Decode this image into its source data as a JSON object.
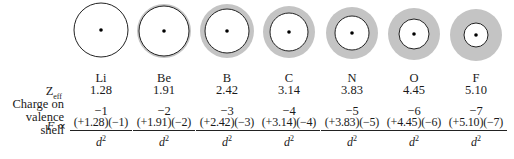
{
  "labels": {
    "zeff_main": "Z",
    "zeff_sub": "eff",
    "charge_line1": "Charge on",
    "charge_line2": "valence shell",
    "force_symbol": "F",
    "proportional": " ∝",
    "denominator_var": "d",
    "denominator_exp": "2"
  },
  "colors": {
    "shell_gray": "#c4c4c4",
    "outline": "#222222",
    "nucleus": "#000000"
  },
  "elements": [
    {
      "symbol": "Li",
      "zeff": "1.28",
      "charge": "−1",
      "numerator": "(+1.28)(−1)",
      "outer_r": 27,
      "inner_r": 27,
      "cx": 101,
      "cy": 30
    },
    {
      "symbol": "Be",
      "zeff": "1.91",
      "charge": "−2",
      "numerator": "(+1.91)(−2)",
      "outer_r": 27,
      "inner_r": 25,
      "cx": 164,
      "cy": 31
    },
    {
      "symbol": "B",
      "zeff": "2.42",
      "charge": "−3",
      "numerator": "(+2.42)(−3)",
      "outer_r": 27,
      "inner_r": 22,
      "cx": 227,
      "cy": 31
    },
    {
      "symbol": "C",
      "zeff": "3.14",
      "charge": "−4",
      "numerator": "(+3.14)(−4)",
      "outer_r": 26,
      "inner_r": 19,
      "cx": 289,
      "cy": 32
    },
    {
      "symbol": "N",
      "zeff": "3.83",
      "charge": "−5",
      "numerator": "(+3.83)(−5)",
      "outer_r": 26,
      "inner_r": 17,
      "cx": 352,
      "cy": 33
    },
    {
      "symbol": "O",
      "zeff": "4.45",
      "charge": "−6",
      "numerator": "(+4.45)(−6)",
      "outer_r": 26,
      "inner_r": 15,
      "cx": 414,
      "cy": 34
    },
    {
      "symbol": "F",
      "zeff": "5.10",
      "charge": "−7",
      "numerator": "(+5.10)(−7)",
      "outer_r": 26,
      "inner_r": 12,
      "cx": 476,
      "cy": 35
    }
  ]
}
